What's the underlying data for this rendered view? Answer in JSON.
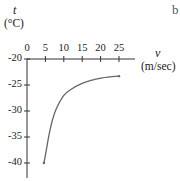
{
  "chart_data": {
    "type": "line",
    "title": "",
    "xlabel": "v",
    "xunit": "(m/sec)",
    "ylabel": "t",
    "yunit": "(°C)",
    "xlim": [
      0,
      27
    ],
    "ylim": [
      -42,
      -20
    ],
    "x_ticks": [
      0,
      5,
      10,
      15,
      20,
      25
    ],
    "y_ticks": [
      -20,
      -25,
      -30,
      -35,
      -40
    ],
    "grid": false,
    "legend": null,
    "series": [
      {
        "name": "wind chill curve",
        "x": [
          4.6,
          5,
          6,
          7,
          8,
          10,
          12,
          15,
          18,
          20,
          22,
          25
        ],
        "y": [
          -40,
          -38.5,
          -34.5,
          -31.5,
          -29.5,
          -27,
          -25.8,
          -24.7,
          -24,
          -23.7,
          -23.5,
          -23.3
        ]
      }
    ]
  },
  "labels": {
    "y_axis_var": "t",
    "y_axis_unit": "(°C)",
    "x_axis_var": "v",
    "x_axis_unit": "(m/sec)",
    "x_tick_labels": [
      "0",
      "5",
      "10",
      "15",
      "20",
      "25"
    ],
    "y_tick_labels": [
      "-20",
      "-25",
      "-30",
      "-35",
      "-40"
    ],
    "corner_fragment": "b"
  },
  "colors": {
    "axis": "#333333",
    "curve": "#666666",
    "text": "#222222"
  }
}
